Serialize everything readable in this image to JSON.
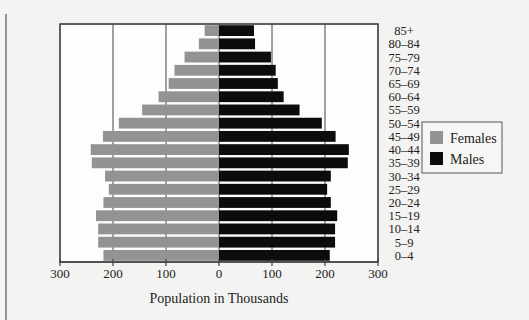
{
  "chart_data": {
    "type": "bar",
    "subtype": "population-pyramid",
    "title": "",
    "xlabel": "Population in Thousands",
    "ylabel": "",
    "xlim": [
      -300,
      300
    ],
    "xticks": [
      -300,
      -200,
      -100,
      0,
      100,
      200,
      300
    ],
    "xtick_labels": [
      "300",
      "200",
      "100",
      "0",
      "100",
      "200",
      "300"
    ],
    "grid": true,
    "legend_position": "right",
    "categories": [
      "85+",
      "80–84",
      "75–79",
      "70–74",
      "65–69",
      "60–64",
      "55–59",
      "50–54",
      "45–49",
      "40–44",
      "35–39",
      "30–34",
      "25–29",
      "20–24",
      "15–19",
      "10–14",
      "5–9",
      "0–4"
    ],
    "series": [
      {
        "name": "Females",
        "color": "#939393",
        "side": "left",
        "values": [
          27,
          38,
          65,
          84,
          95,
          114,
          145,
          189,
          219,
          242,
          240,
          215,
          208,
          218,
          232,
          228,
          228,
          218
        ]
      },
      {
        "name": "Males",
        "color": "#0c0c0c",
        "side": "right",
        "values": [
          66,
          68,
          98,
          107,
          111,
          122,
          152,
          194,
          220,
          245,
          243,
          211,
          204,
          211,
          223,
          219,
          219,
          209
        ]
      }
    ]
  }
}
